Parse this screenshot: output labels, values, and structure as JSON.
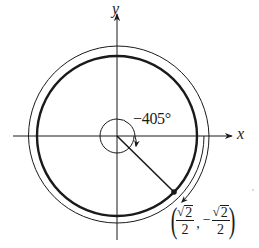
{
  "figure": {
    "type": "unit circle angle diagram",
    "axes": {
      "x_label": "x",
      "y_label": "y"
    },
    "angle": {
      "label": "−405°",
      "degrees": -405,
      "direction": "clockwise"
    },
    "terminal_point": {
      "x_numerator_radicand": "2",
      "x_denominator": "2",
      "x_sign": "",
      "y_numerator_radicand": "2",
      "y_denominator": "2",
      "y_sign": "−",
      "separator": ",",
      "open_paren": "(",
      "close_paren": ")"
    },
    "colors": {
      "stroke": "#1a1a1a",
      "background": "#ffffff"
    }
  }
}
